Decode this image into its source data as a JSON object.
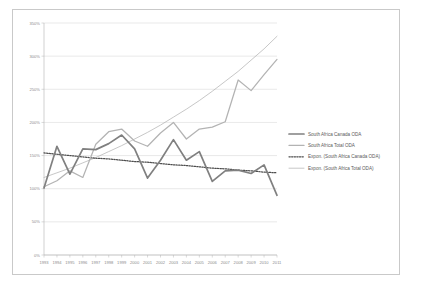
{
  "chart_data": {
    "type": "line",
    "title": "",
    "xlabel": "",
    "ylabel": "",
    "ylim": [
      0,
      350
    ],
    "ytick_labels": [
      "0%",
      "50%",
      "100%",
      "150%",
      "200%",
      "250%",
      "300%",
      "350%"
    ],
    "ytick_values": [
      0,
      50,
      100,
      150,
      200,
      250,
      300,
      350
    ],
    "grid": true,
    "legend_position": "right",
    "x": [
      1993,
      1994,
      1995,
      1996,
      1997,
      1998,
      1999,
      2000,
      2001,
      2002,
      2003,
      2004,
      2005,
      2006,
      2007,
      2008,
      2009,
      2010,
      2011
    ],
    "xtick_labels": [
      "1993",
      "1994",
      "1995",
      "1996",
      "1997",
      "1998",
      "1999",
      "2000",
      "2001",
      "2002",
      "2003",
      "2004",
      "2005",
      "2006",
      "2007",
      "2008",
      "2009",
      "2010",
      "2011"
    ],
    "series": [
      {
        "name": "South Africa Canada ODA",
        "style": "solid-thick",
        "color": "#808080",
        "values": [
          101,
          164,
          122,
          160,
          159,
          168,
          181,
          160,
          116,
          143,
          174,
          143,
          156,
          111,
          127,
          128,
          123,
          136,
          90
        ]
      },
      {
        "name": "South Africa Total ODA",
        "style": "solid-thin",
        "color": "#b3b3b3",
        "values": [
          103,
          112,
          127,
          117,
          167,
          186,
          190,
          172,
          164,
          184,
          200,
          175,
          190,
          193,
          201,
          264,
          248,
          272,
          295
        ]
      },
      {
        "name": "Expon. (South Africa Canada ODA)",
        "style": "dotted",
        "color": "#4d4d4d",
        "values": [
          154,
          152,
          150,
          148,
          146,
          145,
          143,
          141,
          140,
          138,
          136,
          135,
          133,
          131,
          130,
          128,
          127,
          125,
          124
        ]
      },
      {
        "name": "Expon. (South Africa Total ODA)",
        "style": "solid-thin-trend",
        "color": "#a8a8a8",
        "values": [
          117,
          124,
          131,
          139,
          147,
          156,
          165,
          175,
          185,
          196,
          208,
          220,
          233,
          247,
          262,
          277,
          294,
          311,
          330
        ]
      }
    ]
  },
  "legend": {
    "items": [
      {
        "label": "South Africa Canada ODA",
        "style": "solid-thick",
        "color": "#808080"
      },
      {
        "label": "South Africa Total ODA",
        "style": "solid-thin",
        "color": "#b3b3b3"
      },
      {
        "label": "Expon. (South Africa Canada ODA)",
        "style": "dotted",
        "color": "#4d4d4d"
      },
      {
        "label": "Expon. (South Africa Total ODA)",
        "style": "solid-thin-trend",
        "color": "#a8a8a8"
      }
    ]
  }
}
